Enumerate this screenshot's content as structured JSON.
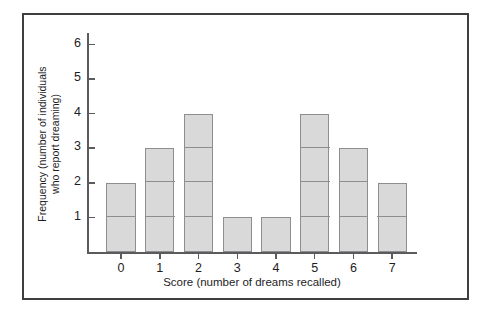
{
  "chart_data": {
    "type": "bar",
    "title": "",
    "subtitle": "",
    "xlabel": "Score (number of dreams recalled)",
    "ylabel_line1": "Frequency (number of individuals",
    "ylabel_line2": "who report dreaming)",
    "ylabel": "Frequency (number of individuals who report dreaming)",
    "categories": [
      "0",
      "1",
      "2",
      "3",
      "4",
      "5",
      "6",
      "7"
    ],
    "values": [
      2,
      3,
      4,
      1,
      1,
      4,
      3,
      2
    ],
    "xticklabels": [
      "0",
      "1",
      "2",
      "3",
      "4",
      "5",
      "6",
      "7"
    ],
    "yticklabels": [
      "1",
      "2",
      "3",
      "4",
      "5",
      "6"
    ],
    "ytickvalues": [
      1,
      2,
      3,
      4,
      5,
      6
    ],
    "ylim": [
      0,
      6.4
    ],
    "xlim": [
      -0.6,
      7.6
    ],
    "grid": false,
    "legend": false,
    "legend_position": "none",
    "stacked_unit_dividers": true
  },
  "style": {
    "bar_fill": "#d9d9d9",
    "bar_edge": "#8e8e90",
    "axis_color": "#5b5b5e",
    "frame_color": "#3f3f42",
    "text_color": "#1d1d1f",
    "background": "#ffffff"
  }
}
